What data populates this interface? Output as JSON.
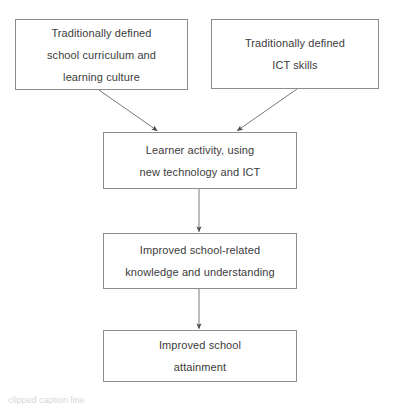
{
  "diagram": {
    "type": "flowchart",
    "title": "",
    "background_color": "#ffffff",
    "box_border_color": "#8d8d8d",
    "text_color": "#3c3c3c",
    "arrow_color": "#6e6e6e",
    "nodes": [
      {
        "id": "traditional-curriculum",
        "lines": [
          "Traditionally defined",
          "school curriculum and",
          "learning culture"
        ],
        "x": 15,
        "y": 19,
        "w": 173,
        "h": 71
      },
      {
        "id": "traditional-ict-skills",
        "lines": [
          "Traditionally defined",
          "ICT skills"
        ],
        "x": 211,
        "y": 19,
        "w": 168,
        "h": 70
      },
      {
        "id": "learner-activity",
        "lines": [
          "Learner activity, using",
          "new technology and ICT"
        ],
        "x": 103,
        "y": 132,
        "w": 194,
        "h": 57
      },
      {
        "id": "improved-knowledge",
        "lines": [
          "Improved school-related",
          "knowledge and understanding"
        ],
        "x": 103,
        "y": 233,
        "w": 194,
        "h": 56
      },
      {
        "id": "improved-attainment",
        "lines": [
          "Improved school",
          "attainment"
        ],
        "x": 103,
        "y": 330,
        "w": 194,
        "h": 52
      }
    ],
    "edges": [
      {
        "id": "curriculum-to-activity",
        "from": "traditional-curriculum",
        "to": "learner-activity",
        "x1": 99,
        "y1": 90,
        "x2": 158,
        "y2": 131
      },
      {
        "id": "ict-to-activity",
        "from": "traditional-ict-skills",
        "to": "learner-activity",
        "x1": 297,
        "y1": 89,
        "x2": 237,
        "y2": 131
      },
      {
        "id": "activity-to-knowledge",
        "from": "learner-activity",
        "to": "improved-knowledge",
        "x1": 199,
        "y1": 189,
        "x2": 199,
        "y2": 232
      },
      {
        "id": "knowledge-to-attainment",
        "from": "improved-knowledge",
        "to": "improved-attainment",
        "x1": 199,
        "y1": 289,
        "x2": 199,
        "y2": 329
      }
    ]
  },
  "caption": {
    "clipped_text": "clipped caption line"
  }
}
